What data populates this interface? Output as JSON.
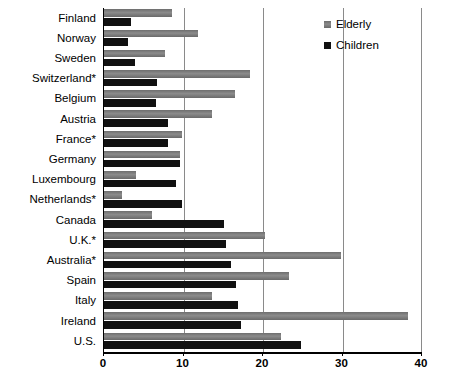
{
  "chart_data": {
    "type": "bar",
    "orientation": "horizontal",
    "title": "",
    "xlabel": "",
    "ylabel": "",
    "xlim": [
      0,
      40
    ],
    "xticks": [
      0,
      10,
      20,
      30,
      40
    ],
    "xtick_labels": [
      "0",
      "10",
      "20",
      "30",
      "40"
    ],
    "grid": true,
    "grid_axis": "x",
    "legend_position": "top-right",
    "categories": [
      "Finland",
      "Norway",
      "Sweden",
      "Switzerland*",
      "Belgium",
      "Austria",
      "France*",
      "Germany",
      "Luxembourg",
      "Netherlands*",
      "Canada",
      "U.K.*",
      "Australia*",
      "Spain",
      "Italy",
      "Ireland",
      "U.S."
    ],
    "series": [
      {
        "name": "Elderly",
        "color": "#808080",
        "values": [
          8.6,
          11.8,
          7.7,
          18.4,
          16.5,
          13.6,
          9.8,
          9.6,
          4.0,
          2.3,
          6.0,
          20.2,
          29.8,
          23.3,
          13.6,
          38.2,
          22.3
        ]
      },
      {
        "name": "Children",
        "color": "#111111",
        "values": [
          3.4,
          3.0,
          3.9,
          6.7,
          6.5,
          8.0,
          8.1,
          9.5,
          9.0,
          9.8,
          15.1,
          15.4,
          16.0,
          16.6,
          16.9,
          17.2,
          24.8
        ]
      }
    ]
  },
  "legend": {
    "entries": [
      {
        "label": "Elderly",
        "swatch": "gray-square-swatch"
      },
      {
        "label": "Children",
        "swatch": "black-square-swatch"
      }
    ]
  }
}
